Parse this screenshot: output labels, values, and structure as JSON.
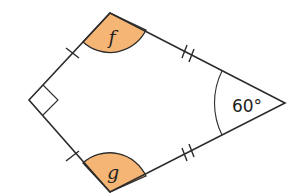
{
  "figure": {
    "shape": "kite",
    "vertices": {
      "top": [
        110,
        13
      ],
      "left": [
        29,
        100
      ],
      "bottom": [
        110,
        192
      ],
      "right": [
        285,
        103
      ]
    },
    "angles": {
      "top": {
        "label": "f",
        "shaded": true
      },
      "bottom": {
        "label": "g",
        "shaded": true
      },
      "left": {
        "label": "",
        "right_angle_marker": true
      },
      "right": {
        "label": "60°",
        "value_degrees": 60
      }
    },
    "equal_side_marks": {
      "short_sides": "single tick",
      "long_sides": "double tick"
    },
    "colors": {
      "shading": "#F5B574",
      "stroke": "#2b2b2b",
      "background": "#ffffff"
    }
  }
}
